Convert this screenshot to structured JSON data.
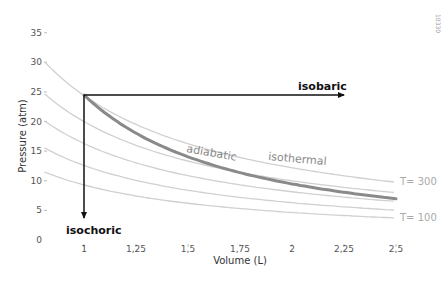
{
  "chart_data": {
    "type": "line",
    "title": "",
    "xlabel": "Volume (L)",
    "ylabel": "Pressure (atm)",
    "xlim": [
      0.81,
      2.5
    ],
    "ylim": [
      0,
      35
    ],
    "grid": false,
    "x_ticks": [
      "1",
      "1,25",
      "1,5",
      "1,75",
      "2",
      "2,25",
      "2,5"
    ],
    "x_tick_values": [
      1,
      1.25,
      1.5,
      1.75,
      2,
      2.25,
      2.5
    ],
    "y_ticks": [
      "0",
      "5",
      "10",
      "15",
      "20",
      "25",
      "30",
      "35"
    ],
    "y_tick_values": [
      0,
      5,
      10,
      15,
      20,
      25,
      30,
      35
    ],
    "isotherms": [
      {
        "name": "T= 300",
        "pv_constant": 24.4
      },
      {
        "name": "",
        "pv_constant": 20.0
      },
      {
        "name": "",
        "pv_constant": 16.3
      },
      {
        "name": "",
        "pv_constant": 12.6
      },
      {
        "name": "T= 100",
        "pv_constant": 9.3
      }
    ],
    "series": [
      {
        "name": "adiabatic",
        "type": "curve",
        "start": [
          1,
          24.5
        ],
        "end": [
          2.5,
          7.0
        ],
        "gamma": 1.37
      },
      {
        "name": "isobaric",
        "type": "arrow",
        "start": [
          1,
          24.5
        ],
        "end": [
          2.5,
          24.5
        ]
      },
      {
        "name": "isochoric",
        "type": "arrow",
        "start": [
          1,
          24.5
        ],
        "end": [
          1,
          3.5
        ]
      }
    ],
    "annotations": [
      "isobaric",
      "isochoric",
      "adiabatic",
      "isothermal",
      "T= 300",
      "T= 100"
    ]
  },
  "labels": {
    "xlabel": "Volume (L)",
    "ylabel": "Pressure (atm)",
    "isobaric": "isobaric",
    "isochoric": "isochoric",
    "adiabatic": "adiabatic",
    "isothermal": "isothermal",
    "t_high": "T= 300",
    "t_low": "T= 100",
    "figure_code": "10330"
  },
  "colors": {
    "isotherm": "#d0d0d0",
    "adiabatic": "#8a8a8a",
    "arrows": "#111111",
    "axis_text": "#555555"
  }
}
